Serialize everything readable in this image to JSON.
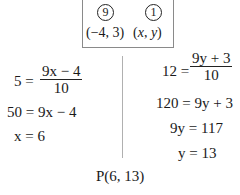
{
  "ratio_box": {
    "ratio_left": "9",
    "ratio_right": "1",
    "point_left": "(−4, 3)",
    "point_right_x": "x",
    "point_right_y": "y"
  },
  "left_steps": {
    "eq1_lhs": "5 =",
    "eq1_num": "9x − 4",
    "eq1_den": "10",
    "eq2": "50 = 9x − 4",
    "eq3": "x = 6"
  },
  "right_steps": {
    "eq1_lhs": "12 =",
    "eq1_num": "9y + 3",
    "eq1_den": "10",
    "eq2": "120 = 9y + 3",
    "eq3": "9y = 117",
    "eq4": "y = 13"
  },
  "result": "P(6, 13)"
}
